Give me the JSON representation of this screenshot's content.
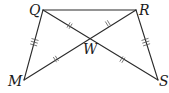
{
  "diagram": {
    "type": "geometry",
    "width": 169,
    "height": 93,
    "colors": {
      "stroke": "#2b2b2b",
      "tick": "#555555",
      "label": "#1a1a1a",
      "background": "#ffffff"
    },
    "points": {
      "Q": {
        "label": "Q",
        "x": 43,
        "y": 10
      },
      "R": {
        "label": "R",
        "x": 136,
        "y": 10
      },
      "M": {
        "label": "M",
        "x": 24,
        "y": 80
      },
      "S": {
        "label": "S",
        "x": 158,
        "y": 80
      },
      "W": {
        "label": "W",
        "x": 90,
        "y": 38
      }
    },
    "segments": [
      {
        "name": "QR",
        "from": "Q",
        "to": "R",
        "ticks": 0
      },
      {
        "name": "QM",
        "from": "Q",
        "to": "M",
        "ticks": 3
      },
      {
        "name": "RS",
        "from": "R",
        "to": "S",
        "ticks": 3
      },
      {
        "name": "QS",
        "from": "Q",
        "to": "S",
        "through": "W"
      },
      {
        "name": "RM",
        "from": "R",
        "to": "M",
        "through": "W"
      }
    ],
    "congruence": [
      {
        "segments": [
          "QM",
          "RS"
        ],
        "tick_marks": 3
      },
      {
        "segments": [
          "QW",
          "WR",
          "MW",
          "WS"
        ],
        "tick_marks": 2
      }
    ]
  }
}
